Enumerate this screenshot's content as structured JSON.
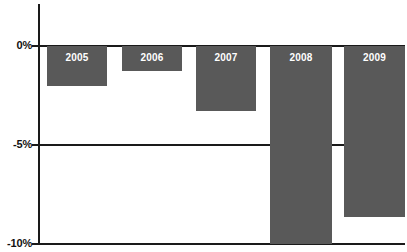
{
  "chart_data": {
    "type": "bar",
    "title": "",
    "subtitle": "",
    "xlabel": "",
    "ylabel": "",
    "categories": [
      "2005",
      "2006",
      "2007",
      "2008",
      "2009"
    ],
    "values": [
      -2.0,
      -1.25,
      -3.3,
      -10.0,
      -8.6
    ],
    "series": [
      {
        "name": "",
        "values": [
          -2.0,
          -1.25,
          -3.3,
          -10.0,
          -8.6
        ]
      }
    ],
    "ylim": [
      -10,
      0
    ],
    "y_ticks": [
      0,
      -5,
      -10
    ],
    "y_tick_labels": [
      "0%",
      "-5%",
      "-10%"
    ],
    "grid": true,
    "legend": false,
    "legend_position": "none",
    "bar_color": "#595959",
    "axis_color": "#1a1a1a",
    "label_color": "#ffffff",
    "background": "#ffffff",
    "bar_labels_inside": true,
    "orientation": "vertical",
    "bars": [
      {
        "category": "2005",
        "value": -2.0,
        "label": "2005"
      },
      {
        "category": "2006",
        "value": -1.25,
        "label": "2006"
      },
      {
        "category": "2007",
        "value": -3.3,
        "label": "2007"
      },
      {
        "category": "2008",
        "value": -10.0,
        "label": "2008"
      },
      {
        "category": "2009",
        "value": -8.6,
        "label": "2009"
      }
    ]
  },
  "axis": {
    "tick_0": "0%",
    "tick_5": "-5%",
    "tick_10": "-10%"
  }
}
